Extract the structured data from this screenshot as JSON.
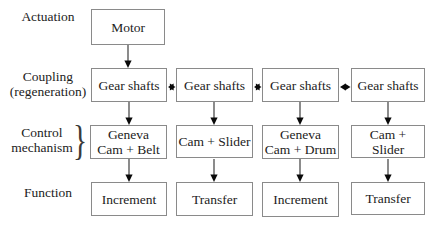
{
  "diagram": {
    "row_labels": {
      "actuation": "Actuation",
      "coupling": "Coupling\n(regeneration)",
      "control": "Control\nmechanism",
      "function": "Function"
    },
    "brace_glyph": "}",
    "motor": "Motor",
    "columns": [
      {
        "coupling": "Gear shafts",
        "control": "Geneva\nCam + Belt",
        "function": "Increment"
      },
      {
        "coupling": "Gear shafts",
        "control": "Cam + Slider",
        "function": "Transfer"
      },
      {
        "coupling": "Gear shafts",
        "control": "Geneva\nCam + Drum",
        "function": "Increment"
      },
      {
        "coupling": "Gear shafts",
        "control": "Cam + Slider",
        "function": "Transfer"
      }
    ],
    "connections": {
      "vertical": "down-arrows: Motor to Gear shafts; each Gear shafts to control box; each control box to function box",
      "horizontal": "double-headed arrows between adjacent Gear shafts boxes"
    },
    "colors": {
      "background": "#ffffff",
      "box_border": "#8a8a8a",
      "text": "#1c1c1c",
      "arrow_line": "#3f3f3f",
      "arrow_head": "#0a0a0a"
    }
  }
}
